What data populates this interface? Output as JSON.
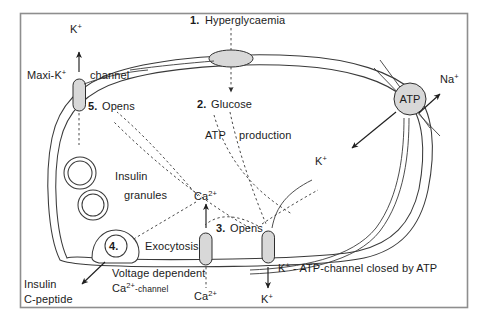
{
  "figure": {
    "frame": {
      "border_color": "#8e8e8e"
    }
  },
  "colors": {
    "ink": "#1b1b1b",
    "membrane": "#3a3a3a",
    "channel_fill": "#d8d8d8",
    "channel_stroke": "#2e2e2e",
    "dashed": "#4a4a4a",
    "frame": "#8e8e8e",
    "background": "#ffffff"
  },
  "steps": [
    {
      "number": "1.",
      "label": "Hyperglycaemia"
    },
    {
      "number": "2.",
      "label": "Glucose"
    },
    {
      "number": "3.",
      "label": "Opens"
    },
    {
      "number": "4.",
      "label": "Exocytosis"
    },
    {
      "number": "5.",
      "label": "Opens"
    }
  ],
  "labels": {
    "step1_number": "1.",
    "step1_text": "Hyperglycaemia",
    "step2_number": "2.",
    "step2_text": "Glucose",
    "step3_number": "3.",
    "step3_text": "Opens",
    "step4_number": "4.",
    "step4_text": "Exocytosis",
    "step5_number": "5.",
    "step5_text": "Opens",
    "atp_production": "ATP",
    "atp_production_word": "production",
    "atp_pump": "ATP",
    "maxi_k_name": "Maxi-K",
    "maxi_k_sup": "+",
    "channel_word": "channel",
    "insulin_granules_line1": "Insulin",
    "insulin_granules_line2": "granules",
    "insulin_cpeptide_line1": "Insulin",
    "insulin_cpeptide_line2": "C-peptide",
    "voltage_dependent": "Voltage dependent",
    "ca_channel_ion": "Ca",
    "ca_channel_sup": "2+",
    "ca_channel_suffix": "-channel",
    "katp_ion": "K",
    "katp_sup": "+",
    "katp_text": "- ATP-channel closed by ATP",
    "ion_k_top": "K",
    "ion_k_top_sup": "+",
    "ion_na": "Na",
    "ion_na_sup": "+",
    "ion_k_inside": "K",
    "ion_k_inside_sup": "+",
    "ion_k_bottom": "K",
    "ion_k_bottom_sup": "+",
    "ion_ca_inside": "Ca",
    "ion_ca_inside_sup": "2+",
    "ion_ca_outside": "Ca",
    "ion_ca_outside_sup": "2+"
  },
  "elements": {
    "glucose_transporter": "glucose-transporter-pore",
    "maxi_k_channel": "maxi-k-channel",
    "calcium_channel": "voltage-dependent-calcium-channel",
    "katp_channel": "k-atp-channel",
    "na_k_atpase": "na-k-atpase-pump",
    "granule_count": 3
  }
}
